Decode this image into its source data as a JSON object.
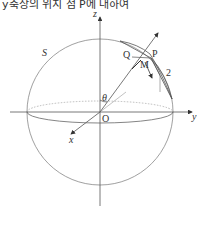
{
  "caption": "y축상의 위치 점 P에 대하여",
  "diagram": {
    "type": "sphere-coordinate-diagram",
    "labels": {
      "z_axis": "z",
      "y_axis": "y",
      "x_axis": "x",
      "origin": "O",
      "sphere": "S",
      "point_p": "P",
      "point_q": "Q",
      "point_m": "M",
      "angle": "θ",
      "region_number": "2"
    },
    "colors": {
      "stroke": "#555555",
      "sphere": "#888888",
      "dotted": "#aaaaaa"
    }
  }
}
